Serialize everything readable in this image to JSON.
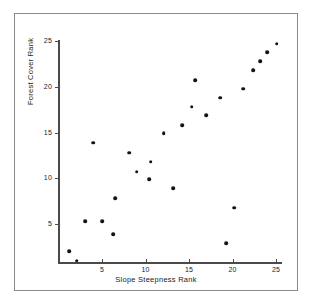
{
  "chart_data": {
    "type": "scatter",
    "title": "",
    "xlabel": "Slope Steepness Rank",
    "ylabel": "Forest Cover Rank",
    "xlim": [
      0,
      26
    ],
    "ylim": [
      0,
      26
    ],
    "xticks": [
      5,
      10,
      15,
      20,
      25
    ],
    "yticks": [
      5,
      10,
      15,
      20,
      25
    ],
    "grid": false,
    "legend": null,
    "marker": "filled-circle",
    "marker_color": "#141414",
    "points": [
      {
        "x": 1.2,
        "y": 2.0
      },
      {
        "x": 2.1,
        "y": 1.0
      },
      {
        "x": 3.1,
        "y": 5.3
      },
      {
        "x": 4.0,
        "y": 13.9
      },
      {
        "x": 5.0,
        "y": 5.3
      },
      {
        "x": 6.3,
        "y": 3.9
      },
      {
        "x": 6.5,
        "y": 7.8
      },
      {
        "x": 8.1,
        "y": 12.8
      },
      {
        "x": 9.0,
        "y": 10.7
      },
      {
        "x": 10.4,
        "y": 9.9
      },
      {
        "x": 10.6,
        "y": 11.8
      },
      {
        "x": 12.1,
        "y": 14.9
      },
      {
        "x": 13.2,
        "y": 8.9
      },
      {
        "x": 14.2,
        "y": 15.8
      },
      {
        "x": 15.3,
        "y": 17.8
      },
      {
        "x": 15.7,
        "y": 20.7
      },
      {
        "x": 17.0,
        "y": 16.9
      },
      {
        "x": 18.6,
        "y": 18.8
      },
      {
        "x": 19.3,
        "y": 2.9
      },
      {
        "x": 20.2,
        "y": 6.8
      },
      {
        "x": 21.2,
        "y": 19.8
      },
      {
        "x": 22.4,
        "y": 21.8
      },
      {
        "x": 23.2,
        "y": 22.8
      },
      {
        "x": 24.0,
        "y": 23.8
      },
      {
        "x": 25.1,
        "y": 24.7
      }
    ]
  },
  "axes": {
    "x_title": "Slope Steepness Rank",
    "y_title": "Forest Cover Rank",
    "x_tick_labels": [
      "5",
      "10",
      "15",
      "20",
      "25"
    ],
    "y_tick_labels": [
      "5",
      "10",
      "15",
      "20",
      "25"
    ]
  },
  "colors": {
    "marker": "#141414",
    "axis": "#4a4a4a",
    "frame": "#8a8a8a",
    "background": "#ffffff",
    "text": "#1a1a1a"
  }
}
